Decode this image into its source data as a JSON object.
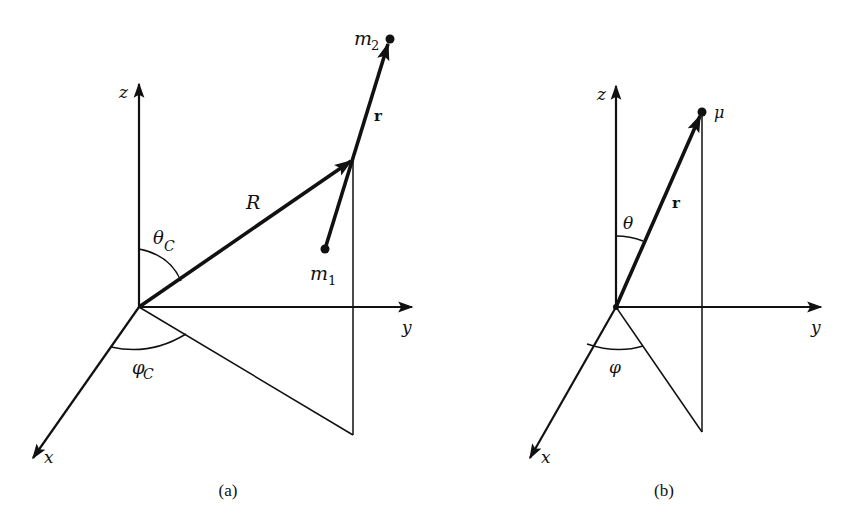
{
  "figure": {
    "panels": [
      {
        "id": "a",
        "caption": "(a)",
        "axes": {
          "z": "z",
          "y": "y",
          "x": "x"
        },
        "vectors": {
          "center_of_mass": "R",
          "relative": "r"
        },
        "angles": {
          "polar": "θ",
          "polar_sub": "C",
          "azimuthal": "φ",
          "azimuthal_sub": "C"
        },
        "points": {
          "mass2": "m",
          "mass2_sub": "2",
          "mass1": "m",
          "mass1_sub": "1"
        }
      },
      {
        "id": "b",
        "caption": "(b)",
        "axes": {
          "z": "z",
          "y": "y",
          "x": "x"
        },
        "vectors": {
          "relative": "r"
        },
        "angles": {
          "polar": "θ",
          "azimuthal": "φ"
        },
        "points": {
          "reduced_mass": "μ"
        }
      }
    ],
    "colors": {
      "ink": "#111111",
      "background": "#ffffff"
    }
  }
}
